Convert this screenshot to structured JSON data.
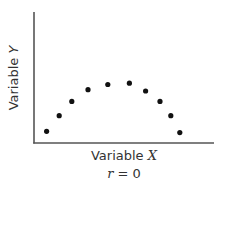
{
  "chart_data": {
    "type": "scatter",
    "title": "",
    "xlabel": "Variable X",
    "ylabel": "Variable Y",
    "annotation": "r = 0",
    "grid": false,
    "ticks": false,
    "xlim": [
      0,
      10
    ],
    "ylim": [
      0,
      10
    ],
    "points": [
      {
        "x": 0.7,
        "y": 0.9
      },
      {
        "x": 1.4,
        "y": 2.1
      },
      {
        "x": 2.1,
        "y": 3.2
      },
      {
        "x": 3.0,
        "y": 4.1
      },
      {
        "x": 4.1,
        "y": 4.5
      },
      {
        "x": 5.3,
        "y": 4.6
      },
      {
        "x": 6.2,
        "y": 4.0
      },
      {
        "x": 7.0,
        "y": 3.2
      },
      {
        "x": 7.6,
        "y": 2.1
      },
      {
        "x": 8.1,
        "y": 0.8
      }
    ],
    "colors": {
      "axis": "#555555",
      "point": "#111111"
    }
  },
  "labels": {
    "x_name": "Variable ",
    "x_var": "X",
    "y_name": "Variable ",
    "y_var": "Y",
    "r_var": "r",
    "r_rest": " = 0"
  }
}
